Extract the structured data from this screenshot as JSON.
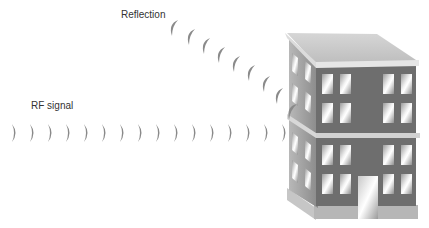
{
  "labels": {
    "reflection": "Reflection",
    "rf_signal": "RF signal"
  },
  "colors": {
    "arc": "#8a8a8a",
    "arc_light": "#c4c4c4",
    "roof": "#c8c8c8",
    "roof_edge": "#e4e4e4",
    "front_wall": "#6e6e6e",
    "side_wall": "#9a9a9a",
    "window_light": "#f2f2f2",
    "window_dark": "#8c8c8c",
    "base": "#b4b4b4",
    "text": "#333333"
  },
  "diagram": {
    "elements": [
      {
        "id": "rf-signal",
        "type": "wave-arcs",
        "direction": "right",
        "count": 16,
        "label": "RF signal"
      },
      {
        "id": "reflection",
        "type": "wave-arcs",
        "direction": "up-left",
        "count": 9,
        "label": "Reflection"
      },
      {
        "id": "building",
        "type": "building-3d",
        "floors": 2,
        "windows_per_floor_front": 8,
        "has_door": true
      }
    ]
  }
}
